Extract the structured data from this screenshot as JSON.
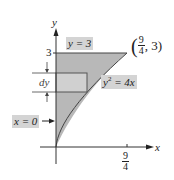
{
  "diagram": {
    "type": "region-between-curves",
    "axes": {
      "x_label": "x",
      "y_label": "y",
      "x_tick": {
        "num": "9",
        "den": "4"
      },
      "y_tick": "3"
    },
    "labels": {
      "line_top": "y = 3",
      "curve_var": "y",
      "curve_exp": "2",
      "curve_rhs": " = 4x",
      "left_bound": "x = 0",
      "strip": "dy",
      "point": {
        "open": "(",
        "num": "9",
        "den": "4",
        "rest": ", 3)",
        "close": ""
      }
    },
    "colors": {
      "region_fill": "#b8b8b8",
      "strip_fill": "#d0d0d0",
      "label_bg": "#d4d4d4",
      "stroke": "#333333"
    }
  }
}
